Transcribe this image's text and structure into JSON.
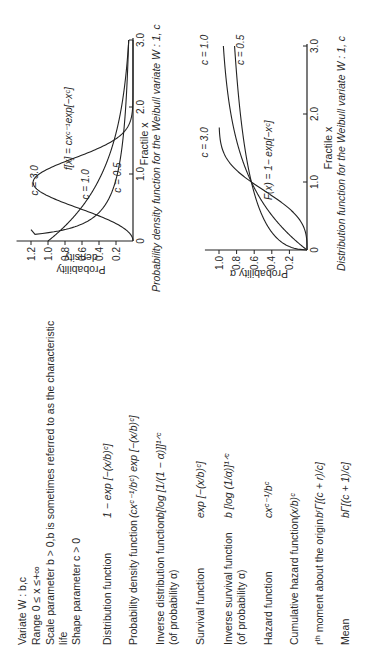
{
  "header": {
    "variate": "Variate W : b,c",
    "range": "Range 0 ≤ x ≤+∞",
    "scale": "Scale parameter b > 0,b is sometimes referred to as the characteristic",
    "scale_cont": "life",
    "shape": "Shape parameter c > 0"
  },
  "properties": [
    {
      "label": "Distribution function",
      "label2": "",
      "formula": "1 − exp [−(x/b)ᶜ]"
    },
    {
      "label": "Probability density function",
      "label2": "",
      "formula": "(cxᶜ⁻¹/bᶜ) exp [−(x/b)ᶜ]"
    },
    {
      "label": "Inverse distribution function",
      "label2": "(of probability α)",
      "formula": "b[log [1/(1 − α)]]¹ᐟᶜ"
    },
    {
      "label": "Survival function",
      "label2": "",
      "formula": "exp [−(x/b)ᶜ]"
    },
    {
      "label": "Inverse survival function",
      "label2": "(of probability α)",
      "formula": "b [log (1/α)]¹ᐟᶜ"
    },
    {
      "label": "Hazard function",
      "label2": "",
      "formula": "cxᶜ⁻¹/bᶜ"
    },
    {
      "label": "Cumulative hazard function",
      "label2": "",
      "formula": "(x/b)ᶜ"
    },
    {
      "label": "rᵗʰ moment about the origin",
      "label2": "",
      "formula": "bʳΓ[(c + r)/c]"
    },
    {
      "label": "Mean",
      "label2": "",
      "formula": "bΓ[(c + 1)/c]"
    }
  ],
  "chart_data": [
    {
      "type": "line",
      "title": "Probability density function for the Weibull variate W : 1, c",
      "xlabel": "Fractile x",
      "ylabel": "Probability density",
      "xlim": [
        0,
        3.0
      ],
      "ylim": [
        0,
        1.3
      ],
      "xticks": [
        "0",
        "1.0",
        "2.0",
        "3.0"
      ],
      "yticks": [
        "0.2",
        "0.4",
        "0.6",
        "0.8",
        "1.0",
        "1.2"
      ],
      "annotation": "f[x] = cxᶜ⁻¹exp[−xᶜ]",
      "function": "pdf",
      "series": [
        {
          "name": "c = 0.5",
          "c": 0.5
        },
        {
          "name": "c = 1.0",
          "c": 1.0
        },
        {
          "name": "c = 3.0",
          "c": 3.0
        }
      ]
    },
    {
      "type": "line",
      "title": "Distribution function for the Weibull variate W : 1, c",
      "xlabel": "Fractile x",
      "ylabel": "Probability α",
      "xlim": [
        0,
        3.0
      ],
      "ylim": [
        0,
        1.1
      ],
      "xticks": [
        "0",
        "1.0",
        "2.0",
        "3.0"
      ],
      "yticks": [
        "0.2",
        "0.4",
        "0.6",
        "0.8",
        "1.0"
      ],
      "annotation": "F(x) = 1− exp[−xᶜ]",
      "function": "cdf",
      "series": [
        {
          "name": "c = 0.5",
          "c": 0.5
        },
        {
          "name": "c = 1.0",
          "c": 1.0
        },
        {
          "name": "c = 3.0",
          "c": 3.0
        }
      ]
    }
  ]
}
